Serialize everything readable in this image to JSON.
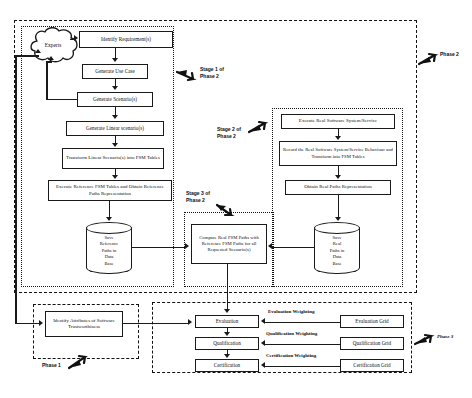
{
  "diagram": {
    "phases": [
      {
        "id": "phase1",
        "label": "Phase 1"
      },
      {
        "id": "phase2",
        "label": "Phase 2"
      },
      {
        "id": "phase3",
        "label": "Phase 3"
      }
    ],
    "stages": [
      {
        "id": "stage1",
        "label": "Stage 1 of\nPhase 2"
      },
      {
        "id": "stage2",
        "label": "Stage 2 of\nPhase 2"
      },
      {
        "id": "stage3",
        "label": "Stage 3 of\nPhase 2"
      }
    ],
    "nodes": {
      "experts": "Experts",
      "identify_requirements": "Identify Requirement(s)",
      "generate_use_case": "Generate Use Case",
      "generate_scenarios": "Generate Scenario(s)",
      "generate_linear_scenarios": "Generate Linear scenario(s)",
      "transform_linear_scenarios": "Transform  Linear Scenario(s) into FSM Tables",
      "execute_reference_fsm": "Execute Reference FSM Tables  and Obtain Reference Paths Representation",
      "save_reference_paths": "Save Reference Paths  in Data Base",
      "execute_real_software": "Execute Real Software System/Service",
      "record_real_software": "Record the Real Software System/Service Behaviour and  Transform into FSM Tables",
      "obtain_real_paths": "Obtain Real Paths Representation",
      "save_real_paths": "Save Real Paths in Data Base",
      "compare_paths": "Compare Real FSM Paths with Reference FSM Paths for all Requested Scenario(s)",
      "identify_attributes": "Identify Attributes of Software Trustworthiness",
      "evaluation": "Evaluation",
      "qualification": "Qualification",
      "certification": "Certification",
      "evaluation_grid": "Evaluation Grid",
      "qualification_grid": "Qualification Grid",
      "certification_grid": "Certification Grid"
    },
    "cylinder_lines": {
      "save_reference_paths": [
        "Save",
        "Reference",
        "Paths  in",
        "Data",
        "Base"
      ],
      "save_real_paths": [
        "Save",
        "Real",
        "Paths in",
        "Data",
        "Base"
      ]
    },
    "edge_labels": {
      "evaluation_weighting": "Evaluation Weighting",
      "qualification_weighting": "Qualification Weighting",
      "certification_weighting": "Certification Weighting"
    },
    "colors": {
      "stroke": "#1a1a1a",
      "text": "#0d0d0d",
      "background": "#ffffff"
    }
  }
}
